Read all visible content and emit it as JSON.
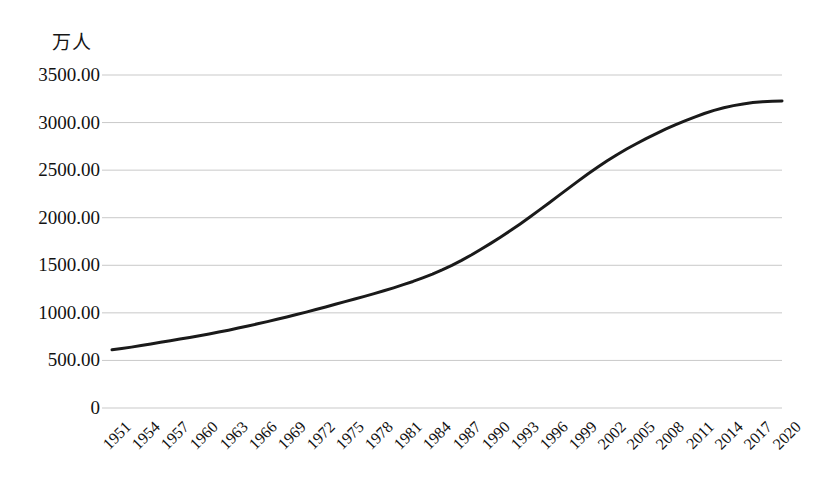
{
  "chart_data": {
    "type": "line",
    "title": "",
    "subtitle": "",
    "xlabel": "",
    "ylabel": "万人",
    "unit_label": "万人",
    "legend": [],
    "legend_position": "none",
    "grid": true,
    "grid_axis": "y",
    "line_color": "#1a1a1a",
    "line_width": 3,
    "xlim": [
      1951,
      2020
    ],
    "ylim": [
      0,
      3500
    ],
    "ytick_labels": [
      "0",
      "500.00",
      "1000.00",
      "1500.00",
      "2000.00",
      "2500.00",
      "3000.00",
      "3500.00"
    ],
    "ytick_values": [
      0,
      500,
      1000,
      1500,
      2000,
      2500,
      3000,
      3500
    ],
    "xtick_labels": [
      "1951",
      "1954",
      "1957",
      "1960",
      "1963",
      "1966",
      "1969",
      "1972",
      "1975",
      "1978",
      "1981",
      "1984",
      "1987",
      "1990",
      "1993",
      "1996",
      "1999",
      "2002",
      "2005",
      "2008",
      "2011",
      "2014",
      "2017",
      "2020"
    ],
    "xtick_values": [
      1951,
      1954,
      1957,
      1960,
      1963,
      1966,
      1969,
      1972,
      1975,
      1978,
      1981,
      1984,
      1987,
      1990,
      1993,
      1996,
      1999,
      2002,
      2005,
      2008,
      2011,
      2014,
      2017,
      2020
    ],
    "x": [
      1951,
      1952,
      1953,
      1954,
      1955,
      1956,
      1957,
      1958,
      1959,
      1960,
      1961,
      1962,
      1963,
      1964,
      1965,
      1966,
      1967,
      1968,
      1969,
      1970,
      1971,
      1972,
      1973,
      1974,
      1975,
      1976,
      1977,
      1978,
      1979,
      1980,
      1981,
      1982,
      1983,
      1984,
      1985,
      1986,
      1987,
      1988,
      1989,
      1990,
      1991,
      1992,
      1993,
      1994,
      1995,
      1996,
      1997,
      1998,
      1999,
      2000,
      2001,
      2002,
      2003,
      2004,
      2005,
      2006,
      2007,
      2008,
      2009,
      2010,
      2011,
      2012,
      2013,
      2014,
      2015,
      2016,
      2017,
      2018,
      2019,
      2020
    ],
    "values": [
      612,
      625,
      640,
      657,
      673,
      690,
      707,
      725,
      742,
      760,
      778,
      798,
      818,
      840,
      862,
      885,
      908,
      932,
      957,
      983,
      1008,
      1035,
      1062,
      1090,
      1118,
      1145,
      1173,
      1202,
      1232,
      1263,
      1296,
      1330,
      1368,
      1408,
      1452,
      1500,
      1552,
      1608,
      1668,
      1730,
      1795,
      1862,
      1932,
      2005,
      2080,
      2155,
      2232,
      2308,
      2385,
      2460,
      2530,
      2598,
      2662,
      2722,
      2778,
      2832,
      2882,
      2930,
      2975,
      3018,
      3058,
      3095,
      3128,
      3155,
      3178,
      3196,
      3210,
      3220,
      3225,
      3228
    ],
    "series": [
      {
        "name": "人口",
        "values": [
          612,
          625,
          640,
          657,
          673,
          690,
          707,
          725,
          742,
          760,
          778,
          798,
          818,
          840,
          862,
          885,
          908,
          932,
          957,
          983,
          1008,
          1035,
          1062,
          1090,
          1118,
          1145,
          1173,
          1202,
          1232,
          1263,
          1296,
          1330,
          1368,
          1408,
          1452,
          1500,
          1552,
          1608,
          1668,
          1730,
          1795,
          1862,
          1932,
          2005,
          2080,
          2155,
          2232,
          2308,
          2385,
          2460,
          2530,
          2598,
          2662,
          2722,
          2778,
          2832,
          2882,
          2930,
          2975,
          3018,
          3058,
          3095,
          3128,
          3155,
          3178,
          3196,
          3210,
          3220,
          3225,
          3228
        ]
      }
    ],
    "annotations": []
  }
}
